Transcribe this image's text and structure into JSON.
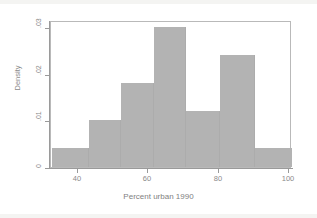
{
  "chart_data": {
    "type": "bar",
    "title": "",
    "subtitle": "",
    "xlabel": "Percent urban 1990",
    "ylabel": "Density",
    "xlim": [
      32.3,
      100.8
    ],
    "ylim": [
      0,
      0.0315
    ],
    "xticks": [
      40,
      60,
      80,
      100
    ],
    "xtick_labels": [
      "40",
      "60",
      "80",
      "100"
    ],
    "yticks": [
      0,
      0.01,
      0.02,
      0.03
    ],
    "ytick_labels": [
      "0",
      ".01",
      ".02",
      ".03"
    ],
    "grid": false,
    "legend": null,
    "bar_color": "#b3b3b3",
    "frame_color": "#b9b9b9",
    "axis_color": "#9a9a9a",
    "bins": [
      {
        "x0": 32.6,
        "x1": 43.0,
        "density": 0.004
      },
      {
        "x0": 43.0,
        "x1": 52.3,
        "density": 0.01
      },
      {
        "x0": 52.3,
        "x1": 61.7,
        "density": 0.018
      },
      {
        "x0": 61.7,
        "x1": 70.8,
        "density": 0.03
      },
      {
        "x0": 70.8,
        "x1": 80.3,
        "density": 0.012
      },
      {
        "x0": 80.3,
        "x1": 90.4,
        "density": 0.024
      },
      {
        "x0": 90.4,
        "x1": 100.8,
        "density": 0.004
      }
    ],
    "categories": [
      "32.6-43.0",
      "43.0-52.3",
      "52.3-61.7",
      "61.7-70.8",
      "70.8-80.3",
      "80.3-90.4",
      "90.4-100.8"
    ],
    "values": [
      0.004,
      0.01,
      0.018,
      0.03,
      0.012,
      0.024,
      0.004
    ]
  }
}
